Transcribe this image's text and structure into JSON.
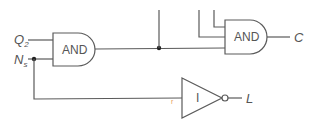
{
  "diagram": {
    "type": "logic-circuit",
    "gates": [
      {
        "id": "and1",
        "type": "AND",
        "label": "AND"
      },
      {
        "id": "and2",
        "type": "AND",
        "label": "AND"
      },
      {
        "id": "inv1",
        "type": "NOT",
        "label": "I"
      }
    ],
    "inputs": {
      "q2": {
        "main": "Q",
        "sub": "2"
      },
      "ns": {
        "main": "N",
        "sub": "s"
      }
    },
    "outputs": {
      "c": "C",
      "l": "L"
    },
    "annotation_mark": "r",
    "colors": {
      "wire": "#5a5a5a",
      "text": "#555555",
      "junction": "#222222",
      "mark": "#e8a060"
    }
  }
}
